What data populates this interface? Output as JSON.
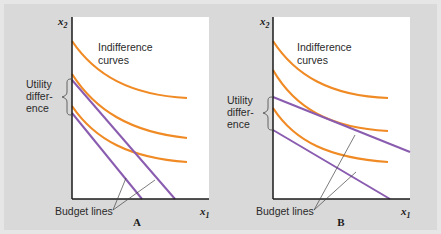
{
  "colors": {
    "indifference_curve": "#f08a24",
    "budget_line": "#8a5cb0",
    "axis": "#1a1a1a",
    "plot_bg": "#ffffff",
    "figure_bg": "#d9d9d9"
  },
  "panels": [
    {
      "title": "A",
      "y_axis_label": "x",
      "y_axis_sub": "2",
      "x_axis_label": "x",
      "x_axis_sub": "1",
      "curves_label_line1": "Indifference",
      "curves_label_line2": "curves",
      "utility_label_line1": "Utility",
      "utility_label_line2": "differ-",
      "utility_label_line3": "ence",
      "budget_label": "Budget lines"
    },
    {
      "title": "B",
      "y_axis_label": "x",
      "y_axis_sub": "2",
      "x_axis_label": "x",
      "x_axis_sub": "1",
      "curves_label_line1": "Indifference",
      "curves_label_line2": "curves",
      "utility_label_line1": "Utility",
      "utility_label_line2": "differ-",
      "utility_label_line3": "ence",
      "budget_label": "Budget lines"
    }
  ]
}
